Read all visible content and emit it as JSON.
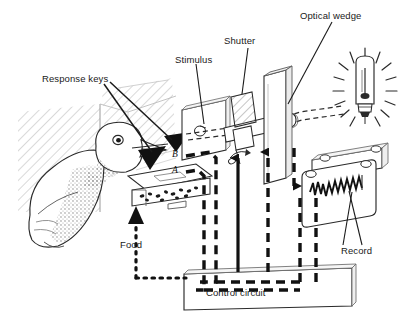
{
  "figure": {
    "background_color": "#ffffff",
    "ink_color": "#1a1a1a",
    "width": 404,
    "height": 318
  },
  "labels": {
    "response_keys": "Response keys",
    "stimulus": "Stimulus",
    "shutter": "Shutter",
    "optical_wedge": "Optical wedge",
    "record": "Record",
    "food": "Food",
    "control_circuit": "Control circuit",
    "key_b": "B",
    "key_a": "A"
  },
  "components": [
    {
      "name": "pigeon",
      "label": null
    },
    {
      "name": "hatched-chamber-wall",
      "label": null
    },
    {
      "name": "response-key-panel",
      "label": "Response keys"
    },
    {
      "name": "food-hopper",
      "label": "Food"
    },
    {
      "name": "stimulus-panel",
      "label": "Stimulus"
    },
    {
      "name": "shutter",
      "label": "Shutter"
    },
    {
      "name": "optical-wedge",
      "label": "Optical wedge"
    },
    {
      "name": "lamp",
      "label": null
    },
    {
      "name": "cumulative-recorder-drum",
      "label": "Record"
    },
    {
      "name": "control-circuit-box",
      "label": "Control circuit"
    }
  ],
  "signal_lines": [
    {
      "name": "key-b-signal",
      "style": "dashed",
      "label": "B"
    },
    {
      "name": "key-a-signal",
      "style": "dashed",
      "label": "A"
    },
    {
      "name": "food-delivery",
      "style": "dotted",
      "label": "Food"
    },
    {
      "name": "recorder-drive",
      "style": "solid-arrow-up",
      "label": null
    },
    {
      "name": "wedge-drive-up",
      "style": "dashed-arrow-up",
      "label": null
    },
    {
      "name": "wedge-drive-down",
      "style": "dashed-arrow-down",
      "label": null
    },
    {
      "name": "light-beam",
      "style": "dashed-horizontal",
      "label": null
    }
  ]
}
